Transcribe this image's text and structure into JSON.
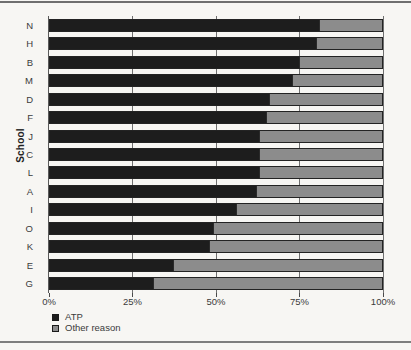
{
  "figure": {
    "background": "#f7f6f3",
    "top_rule_color": "#6f6f6f",
    "bottom_rule_color": "#7e7e7e"
  },
  "chart_data": {
    "type": "bar",
    "orientation": "horizontal",
    "stacked": true,
    "title": "",
    "xlabel": "",
    "ylabel": "School",
    "categories": [
      "N",
      "H",
      "B",
      "M",
      "D",
      "F",
      "J",
      "C",
      "L",
      "A",
      "I",
      "O",
      "K",
      "E",
      "G"
    ],
    "series": [
      {
        "name": "ATP",
        "color": "#1d1d1d",
        "values": [
          81,
          80,
          75,
          73,
          66,
          65,
          63,
          63,
          63,
          62,
          56,
          49,
          48,
          37,
          31
        ]
      },
      {
        "name": "Other reason",
        "color": "#8c8c8c",
        "values": [
          19,
          20,
          25,
          27,
          34,
          35,
          37,
          37,
          37,
          38,
          44,
          51,
          52,
          63,
          69
        ]
      }
    ],
    "xlim": [
      0,
      100
    ],
    "x_ticks": [
      {
        "value": 0,
        "label": "0%"
      },
      {
        "value": 25,
        "label": "25%"
      },
      {
        "value": 50,
        "label": "50%"
      },
      {
        "value": 75,
        "label": "75%"
      },
      {
        "value": 100,
        "label": "100%"
      }
    ],
    "grid": true,
    "gridline_color": "#6f6f6f",
    "legend_position": "bottom-left"
  },
  "legend": {
    "atp_label": "ATP",
    "other_label": "Other reason"
  }
}
